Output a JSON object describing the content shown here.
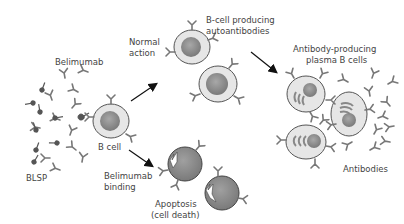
{
  "labels": {
    "belimumab": "Belimumab",
    "blsp": "BLSP",
    "b_cell": "B cell",
    "normal_action_1": "Normal",
    "normal_action_2": "action",
    "producing_1": "B-cell producing",
    "producing_2": "autoantibodies",
    "plasma_1": "Antibody-producing",
    "plasma_2": "plasma B cells",
    "antibodies": "Antibodies",
    "binding_1": "Belimumab",
    "binding_2": "binding",
    "apoptosis_1": "Apoptosis",
    "apoptosis_2": "(cell death)"
  },
  "colors": {
    "cell_fill": "#e6e6e6",
    "cell_stroke": "#555555",
    "nucleus": "#8a8a8a",
    "apoptotic_fill": "#8c8c8c",
    "antibody": "#777777",
    "blsp": "#555555",
    "arrow": "#111111",
    "text": "#444444"
  }
}
